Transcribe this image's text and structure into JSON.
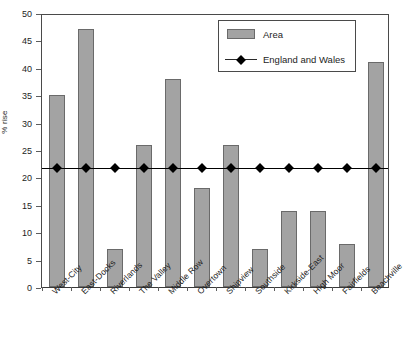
{
  "chart_data": {
    "type": "bar",
    "title": "",
    "subtitle": "",
    "xlabel": "",
    "ylabel": "% rise",
    "ylim": [
      0,
      50
    ],
    "yticks": [
      0,
      5,
      10,
      15,
      20,
      25,
      30,
      35,
      40,
      45,
      50
    ],
    "grid": false,
    "legend_position": "top-right",
    "categories": [
      "West-City",
      "East-Docks",
      "Riverlands",
      "The Valley",
      "Middle Row",
      "Overtown",
      "Shipview",
      "Southside",
      "Kirkside-East",
      "High Moor",
      "Fairfields",
      "Beachville"
    ],
    "series": [
      {
        "name": "Area",
        "type": "bar",
        "color": "#a3a3a3",
        "values": [
          35,
          47,
          7,
          26,
          38,
          18,
          26,
          7,
          13.8,
          13.8,
          7.8,
          41
        ]
      },
      {
        "name": "England and Wales",
        "type": "line",
        "color": "#000000",
        "values": [
          22,
          22,
          22,
          22,
          22,
          22,
          22,
          22,
          22,
          22,
          22,
          22
        ]
      }
    ],
    "reference_value": 22
  },
  "legend": {
    "entries": [
      {
        "label": "Area",
        "marker": "bar-swatch"
      },
      {
        "label": "England and Wales",
        "marker": "line-diamond"
      }
    ]
  },
  "axes": {
    "y_title": "% rise"
  },
  "colors": {
    "bar_fill": "#a3a3a3",
    "bar_stroke": "#6a6a6a",
    "line": "#000000",
    "axis": "#4a4a4a",
    "background": "#ffffff"
  }
}
